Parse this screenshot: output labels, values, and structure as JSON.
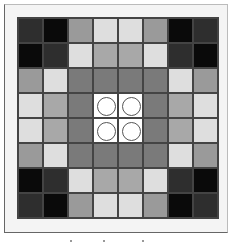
{
  "diagram": {
    "title": "",
    "rows": 8,
    "cols": 8,
    "palette": {
      "K": "#0a0a0a",
      "D": "#2e2e2e",
      "G": "#9a9a9a",
      "L": "#dedede",
      "M": "#7a7a7a",
      "A": "#a8a8a8",
      "W": "#ffffff"
    },
    "cells": [
      [
        "D",
        "K",
        "G",
        "L",
        "L",
        "G",
        "K",
        "D"
      ],
      [
        "K",
        "D",
        "L",
        "A",
        "A",
        "L",
        "D",
        "K"
      ],
      [
        "G",
        "L",
        "M",
        "M",
        "M",
        "M",
        "L",
        "G"
      ],
      [
        "L",
        "A",
        "M",
        "W",
        "W",
        "M",
        "A",
        "L"
      ],
      [
        "L",
        "A",
        "M",
        "W",
        "W",
        "M",
        "A",
        "L"
      ],
      [
        "G",
        "L",
        "M",
        "M",
        "M",
        "M",
        "L",
        "G"
      ],
      [
        "K",
        "D",
        "L",
        "A",
        "A",
        "L",
        "D",
        "K"
      ],
      [
        "D",
        "K",
        "G",
        "L",
        "L",
        "G",
        "K",
        "D"
      ]
    ],
    "markers": [
      {
        "row": 3,
        "col": 3,
        "shape": "circle"
      },
      {
        "row": 3,
        "col": 4,
        "shape": "circle"
      },
      {
        "row": 4,
        "col": 3,
        "shape": "circle"
      },
      {
        "row": 4,
        "col": 4,
        "shape": "circle"
      }
    ]
  }
}
